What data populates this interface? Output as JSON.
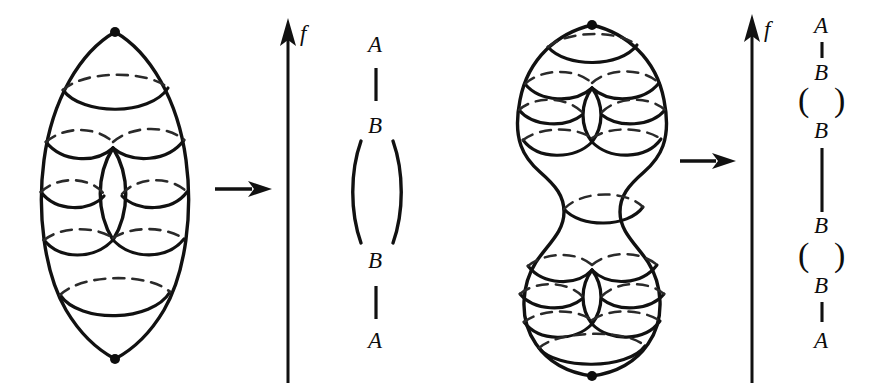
{
  "figure": {
    "background_color": "#ffffff",
    "ink_color": "#111111",
    "width": 870,
    "height": 383
  },
  "panels": [
    {
      "id": "left",
      "surface": {
        "name": "genus-one-torus",
        "genus": 1,
        "description": "Oval torus with one central hole, sliced by level curves",
        "critical_points": [
          {
            "type": "maximum",
            "label": "A"
          },
          {
            "type": "saddle",
            "label": "B"
          },
          {
            "type": "saddle",
            "label": "B"
          },
          {
            "type": "minimum",
            "label": "A"
          }
        ],
        "level_curve_count": 4
      },
      "map_arrow": {
        "glyph": "right-arrow",
        "direction": "right"
      },
      "axis": {
        "label": "f",
        "direction": "up"
      },
      "reeb_graph": {
        "nodes": [
          "A",
          "B",
          "B",
          "A"
        ],
        "edges": [
          "single",
          "double-loop",
          "single"
        ],
        "rendered_sequence": [
          "A",
          "|",
          "B",
          "(",
          ")",
          "B",
          "|",
          "A"
        ]
      }
    },
    {
      "id": "right",
      "surface": {
        "name": "genus-two-surface",
        "genus": 2,
        "description": "Peanut shaped double torus with two holes, sliced by level curves",
        "critical_points": [
          {
            "type": "maximum",
            "label": "A"
          },
          {
            "type": "saddle",
            "label": "B"
          },
          {
            "type": "saddle",
            "label": "B"
          },
          {
            "type": "saddle",
            "label": "B"
          },
          {
            "type": "saddle",
            "label": "B"
          },
          {
            "type": "minimum",
            "label": "A"
          }
        ],
        "level_curve_count": 7
      },
      "map_arrow": {
        "glyph": "right-arrow",
        "direction": "right"
      },
      "axis": {
        "label": "f",
        "direction": "up"
      },
      "reeb_graph": {
        "nodes": [
          "A",
          "B",
          "B",
          "B",
          "B",
          "A"
        ],
        "edges": [
          "single",
          "double-loop",
          "single",
          "double-loop",
          "single"
        ],
        "rendered_sequence": [
          "A",
          "|",
          "B",
          "(",
          ")",
          "B",
          "|",
          "B",
          "(",
          ")",
          "B",
          "|",
          "A"
        ]
      }
    }
  ],
  "labels": {
    "A": "A",
    "B": "B",
    "f": "f",
    "paren_open": "(",
    "paren_close": ")"
  }
}
